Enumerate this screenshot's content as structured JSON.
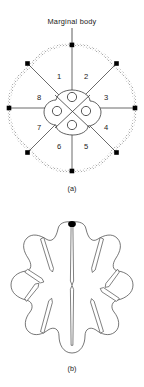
{
  "figure": {
    "background_color": "#ffffff",
    "ink_color": "#1a1a1a",
    "annotation": {
      "label": "Marginal body",
      "leader_line": "vertical"
    },
    "panels": [
      {
        "id": "a",
        "caption": "(a)",
        "type": "cross-section-diagram",
        "description": "Circular cross-section with eight radial sectors, stippled marginal rim and central quatrefoil",
        "center": {
          "cx": 72,
          "cy": 108
        },
        "outer_radius": 63,
        "sector_labels": [
          "1",
          "2",
          "3",
          "4",
          "5",
          "6",
          "7",
          "8"
        ],
        "sector_label_positions": [
          {
            "label": "1",
            "x": 59,
            "y": 77
          },
          {
            "label": "2",
            "x": 86,
            "y": 77
          },
          {
            "label": "3",
            "x": 106,
            "y": 98
          },
          {
            "label": "4",
            "x": 106,
            "y": 128
          },
          {
            "label": "5",
            "x": 86,
            "y": 147
          },
          {
            "label": "6",
            "x": 59,
            "y": 147
          },
          {
            "label": "7",
            "x": 39,
            "y": 128
          },
          {
            "label": "8",
            "x": 39,
            "y": 98
          }
        ],
        "marginal_body_count": 8,
        "marginal_body_color": "#000000",
        "central_circle_count": 4,
        "rim_texture": "stippled"
      },
      {
        "id": "b",
        "caption": "(b)",
        "type": "outline-diagram",
        "description": "Eight-lobed rosette outline with deep narrow clefts and a single marginal body at top",
        "center": {
          "cx": 72,
          "cy": 288
        },
        "lobe_count": 8,
        "marginal_body_count": 1,
        "marginal_body_color": "#000000"
      }
    ]
  }
}
